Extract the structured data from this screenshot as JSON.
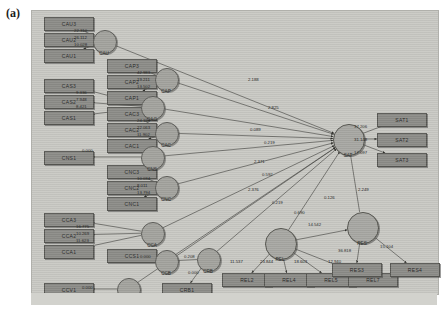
{
  "figure": {
    "panel_label": "(a)"
  },
  "palette": {
    "canvas_bg": "#c9c9c4",
    "observed_fill": "#8c8c88",
    "latent_fill": "#a3a39e",
    "stroke": "#3b3b37",
    "text": "#23231f"
  },
  "observed": [
    {
      "id": "cau1",
      "label": "CAU3",
      "x": 12,
      "y": 6
    },
    {
      "id": "cau2",
      "label": "CAU2",
      "x": 12,
      "y": 22
    },
    {
      "id": "cau3",
      "label": "CAU1",
      "x": 12,
      "y": 38
    },
    {
      "id": "cap1",
      "label": "CAP3",
      "x": 75,
      "y": 48
    },
    {
      "id": "cap2",
      "label": "CAP2",
      "x": 75,
      "y": 64
    },
    {
      "id": "cap3",
      "label": "CAP1",
      "x": 75,
      "y": 80
    },
    {
      "id": "cas1",
      "label": "CAS3",
      "x": 12,
      "y": 68
    },
    {
      "id": "cas2",
      "label": "CAS2",
      "x": 12,
      "y": 84
    },
    {
      "id": "cas3",
      "label": "CAS1",
      "x": 12,
      "y": 100
    },
    {
      "id": "cac1",
      "label": "CAC3",
      "x": 75,
      "y": 96
    },
    {
      "id": "cac2",
      "label": "CAC2",
      "x": 75,
      "y": 112
    },
    {
      "id": "cac3",
      "label": "CAC1",
      "x": 75,
      "y": 128
    },
    {
      "id": "cns1",
      "label": "CNS1",
      "x": 12,
      "y": 140
    },
    {
      "id": "cnc1",
      "label": "CNC3",
      "x": 75,
      "y": 154
    },
    {
      "id": "cnc2",
      "label": "CNC2",
      "x": 75,
      "y": 170
    },
    {
      "id": "cnc3",
      "label": "CNC1",
      "x": 75,
      "y": 186
    },
    {
      "id": "cca1",
      "label": "CCA3",
      "x": 12,
      "y": 202
    },
    {
      "id": "cca2",
      "label": "CCA2",
      "x": 12,
      "y": 218
    },
    {
      "id": "cca3",
      "label": "CCA1",
      "x": 12,
      "y": 234
    },
    {
      "id": "ccs1",
      "label": "CCS1",
      "x": 75,
      "y": 238
    },
    {
      "id": "ccv1",
      "label": "CCV1",
      "x": 12,
      "y": 272
    },
    {
      "id": "crb1",
      "label": "CRB1",
      "x": 130,
      "y": 272
    },
    {
      "id": "sat1",
      "label": "SAT1",
      "x": 345,
      "y": 102
    },
    {
      "id": "sat2",
      "label": "SAT2",
      "x": 345,
      "y": 122
    },
    {
      "id": "sat3",
      "label": "SAT3",
      "x": 345,
      "y": 142
    },
    {
      "id": "rel1",
      "label": "REL2",
      "x": 190,
      "y": 262
    },
    {
      "id": "rel2",
      "label": "REL4",
      "x": 232,
      "y": 262
    },
    {
      "id": "rel3",
      "label": "REL5",
      "x": 274,
      "y": 262
    },
    {
      "id": "rel4",
      "label": "REL7",
      "x": 316,
      "y": 262
    },
    {
      "id": "res1",
      "label": "RES3",
      "x": 300,
      "y": 252
    },
    {
      "id": "res2",
      "label": "RES4",
      "x": 358,
      "y": 252
    }
  ],
  "latents": [
    {
      "id": "CAU",
      "label": "CAU",
      "cx": 72,
      "cy": 30
    },
    {
      "id": "CAP",
      "label": "CAP",
      "cx": 134,
      "cy": 68
    },
    {
      "id": "CAG",
      "label": "CAG",
      "cx": 120,
      "cy": 96
    },
    {
      "id": "CAC",
      "label": "CAC",
      "cx": 134,
      "cy": 122
    },
    {
      "id": "CNS",
      "label": "CNS",
      "cx": 120,
      "cy": 146
    },
    {
      "id": "CNC",
      "label": "CNC",
      "cx": 134,
      "cy": 176
    },
    {
      "id": "CCA",
      "label": "CCA",
      "cx": 120,
      "cy": 222
    },
    {
      "id": "CCB",
      "label": "CCB",
      "cx": 134,
      "cy": 250
    },
    {
      "id": "CRB",
      "label": "CRB",
      "cx": 176,
      "cy": 248
    },
    {
      "id": "CCV",
      "label": "CCV",
      "cx": 96,
      "cy": 278
    },
    {
      "id": "SAT",
      "label": "SAT",
      "cx": 316,
      "cy": 128
    },
    {
      "id": "REL",
      "label": "REL",
      "cx": 248,
      "cy": 232
    },
    {
      "id": "RES",
      "label": "RES",
      "cx": 330,
      "cy": 216
    }
  ],
  "coefficients": [
    {
      "id": "c-cau3",
      "value": "22.310",
      "x": 42,
      "y": 17
    },
    {
      "id": "c-cau2",
      "value": "26.112",
      "x": 42,
      "y": 24
    },
    {
      "id": "c-cau1",
      "value": "10.028",
      "x": 42,
      "y": 31
    },
    {
      "id": "c-cap3",
      "value": "42.983",
      "x": 105,
      "y": 59
    },
    {
      "id": "c-cap2",
      "value": "19.211",
      "x": 105,
      "y": 66
    },
    {
      "id": "c-cap1",
      "value": "13.502",
      "x": 105,
      "y": 73
    },
    {
      "id": "c-cas3",
      "value": "9.336",
      "x": 44,
      "y": 79
    },
    {
      "id": "c-cas2",
      "value": "7.948",
      "x": 44,
      "y": 86
    },
    {
      "id": "c-cas1",
      "value": "8.421",
      "x": 44,
      "y": 93
    },
    {
      "id": "c-cac3",
      "value": "24.154",
      "x": 105,
      "y": 107
    },
    {
      "id": "c-cac2",
      "value": "22.063",
      "x": 105,
      "y": 114
    },
    {
      "id": "c-cac1",
      "value": "11.902",
      "x": 105,
      "y": 121
    },
    {
      "id": "c-cns1",
      "value": "0.000",
      "x": 50,
      "y": 137
    },
    {
      "id": "c-cnc3",
      "value": "10.034",
      "x": 105,
      "y": 165
    },
    {
      "id": "c-cnc2",
      "value": "8.011",
      "x": 105,
      "y": 172
    },
    {
      "id": "c-cnc1",
      "value": "13.794",
      "x": 105,
      "y": 179
    },
    {
      "id": "c-cca3",
      "value": "16.775",
      "x": 44,
      "y": 213
    },
    {
      "id": "c-cca2",
      "value": "10.269",
      "x": 44,
      "y": 220
    },
    {
      "id": "c-cca1",
      "value": "11.623",
      "x": 44,
      "y": 227
    },
    {
      "id": "c-ccs1",
      "value": "0.000",
      "x": 108,
      "y": 243
    },
    {
      "id": "c-ccv1",
      "value": "0.000",
      "x": 50,
      "y": 274
    },
    {
      "id": "c-crb1",
      "value": "0.000",
      "x": 156,
      "y": 259
    },
    {
      "id": "c-ccb",
      "value": "0.208",
      "x": 152,
      "y": 243
    },
    {
      "id": "c-p1",
      "value": "2.188",
      "x": 216,
      "y": 66
    },
    {
      "id": "c-p2",
      "value": "2.825",
      "x": 236,
      "y": 94
    },
    {
      "id": "c-p3",
      "value": "0.089",
      "x": 218,
      "y": 116
    },
    {
      "id": "c-p4",
      "value": "0.219",
      "x": 232,
      "y": 129
    },
    {
      "id": "c-p5",
      "value": "2.371",
      "x": 222,
      "y": 148
    },
    {
      "id": "c-p6",
      "value": "0.592",
      "x": 230,
      "y": 161
    },
    {
      "id": "c-p7",
      "value": "2.376",
      "x": 216,
      "y": 176
    },
    {
      "id": "c-p8",
      "value": "0.219",
      "x": 240,
      "y": 189
    },
    {
      "id": "c-p9",
      "value": "0.690",
      "x": 262,
      "y": 199
    },
    {
      "id": "c-p10",
      "value": "0.126",
      "x": 292,
      "y": 184
    },
    {
      "id": "c-p11",
      "value": "2.249",
      "x": 326,
      "y": 176
    },
    {
      "id": "c-sat1",
      "value": "37.206",
      "x": 322,
      "y": 113
    },
    {
      "id": "c-sat2",
      "value": "31.148",
      "x": 322,
      "y": 126
    },
    {
      "id": "c-sat3",
      "value": "17.097",
      "x": 322,
      "y": 139
    },
    {
      "id": "c-rel1",
      "value": "11.537",
      "x": 198,
      "y": 248
    },
    {
      "id": "c-rel2",
      "value": "23.844",
      "x": 228,
      "y": 248
    },
    {
      "id": "c-rel3",
      "value": "18.603",
      "x": 262,
      "y": 248
    },
    {
      "id": "c-rel4",
      "value": "12.940",
      "x": 296,
      "y": 248
    },
    {
      "id": "c-res",
      "value": "14.542",
      "x": 276,
      "y": 211
    },
    {
      "id": "c-res1",
      "value": "36.818",
      "x": 306,
      "y": 237
    },
    {
      "id": "c-res2",
      "value": "15.104",
      "x": 348,
      "y": 233
    }
  ],
  "edges": [
    {
      "from": "CAU",
      "to": "obs:cau1"
    },
    {
      "from": "CAU",
      "to": "obs:cau2"
    },
    {
      "from": "CAU",
      "to": "obs:cau3"
    },
    {
      "from": "CAP",
      "to": "obs:cap1"
    },
    {
      "from": "CAP",
      "to": "obs:cap2"
    },
    {
      "from": "CAP",
      "to": "obs:cap3"
    },
    {
      "from": "CAG",
      "to": "obs:cas1"
    },
    {
      "from": "CAG",
      "to": "obs:cas2"
    },
    {
      "from": "CAG",
      "to": "obs:cas3"
    },
    {
      "from": "CAC",
      "to": "obs:cac1"
    },
    {
      "from": "CAC",
      "to": "obs:cac2"
    },
    {
      "from": "CAC",
      "to": "obs:cac3"
    },
    {
      "from": "CNS",
      "to": "obs:cns1"
    },
    {
      "from": "CNC",
      "to": "obs:cnc1"
    },
    {
      "from": "CNC",
      "to": "obs:cnc2"
    },
    {
      "from": "CNC",
      "to": "obs:cnc3"
    },
    {
      "from": "CCA",
      "to": "obs:cca1"
    },
    {
      "from": "CCA",
      "to": "obs:cca2"
    },
    {
      "from": "CCA",
      "to": "obs:cca3"
    },
    {
      "from": "CCB",
      "to": "obs:ccs1"
    },
    {
      "from": "CCV",
      "to": "obs:ccv1"
    },
    {
      "from": "CRB",
      "to": "obs:crb1"
    },
    {
      "from": "CRB",
      "to": "CCB"
    },
    {
      "from": "CAU",
      "to": "SAT"
    },
    {
      "from": "CAP",
      "to": "SAT"
    },
    {
      "from": "CAG",
      "to": "SAT"
    },
    {
      "from": "CAC",
      "to": "SAT"
    },
    {
      "from": "CNS",
      "to": "SAT"
    },
    {
      "from": "CNC",
      "to": "SAT"
    },
    {
      "from": "CCA",
      "to": "SAT"
    },
    {
      "from": "CCB",
      "to": "SAT"
    },
    {
      "from": "CRB",
      "to": "SAT"
    },
    {
      "from": "CCV",
      "to": "SAT"
    },
    {
      "from": "REL",
      "to": "SAT"
    },
    {
      "from": "RES",
      "to": "SAT"
    },
    {
      "from": "REL",
      "to": "RES"
    },
    {
      "from": "REL",
      "to": "obs:rel1"
    },
    {
      "from": "REL",
      "to": "obs:rel2"
    },
    {
      "from": "REL",
      "to": "obs:rel3"
    },
    {
      "from": "REL",
      "to": "obs:rel4"
    },
    {
      "from": "RES",
      "to": "obs:res1"
    },
    {
      "from": "RES",
      "to": "obs:res2"
    },
    {
      "from": "SAT",
      "to": "obs:sat1"
    },
    {
      "from": "SAT",
      "to": "obs:sat2"
    },
    {
      "from": "SAT",
      "to": "obs:sat3"
    }
  ]
}
